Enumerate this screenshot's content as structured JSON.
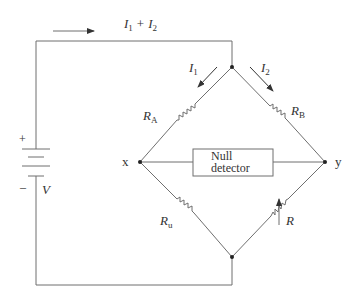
{
  "diagram": {
    "colors": {
      "wire": "#6f6f6f",
      "text": "#333333",
      "node": "#222222",
      "background": "#ffffff"
    },
    "labels": {
      "total_current_I": "I",
      "total_current_sub1": "1",
      "total_current_plus": "+",
      "total_current_I2": "I",
      "total_current_sub2": "2",
      "i1_main": "I",
      "i1_sub": "1",
      "i2_main": "I",
      "i2_sub": "2",
      "ra_main": "R",
      "ra_sub": "A",
      "rb_main": "R",
      "rb_sub": "B",
      "ru_main": "R",
      "ru_sub": "u",
      "r_var": "R",
      "node_x": "x",
      "node_y": "y",
      "battery_plus": "+",
      "battery_minus": "–",
      "battery_voltage": "V",
      "detector_line1": "Null",
      "detector_line2": "detector"
    },
    "components": [
      {
        "id": "battery",
        "type": "battery",
        "label": "V"
      },
      {
        "id": "RA",
        "type": "resistor",
        "label": "R_A",
        "branch": "top-left"
      },
      {
        "id": "RB",
        "type": "resistor",
        "label": "R_B",
        "branch": "top-right"
      },
      {
        "id": "Ru",
        "type": "resistor",
        "label": "R_u",
        "branch": "bottom-left"
      },
      {
        "id": "R",
        "type": "variable-resistor",
        "label": "R",
        "branch": "bottom-right"
      },
      {
        "id": "detector",
        "type": "null-detector",
        "label": "Null detector",
        "between": [
          "x",
          "y"
        ]
      }
    ],
    "currents": [
      {
        "label": "I1 + I2",
        "direction": "right",
        "location": "top wire"
      },
      {
        "label": "I1",
        "direction": "down-left",
        "location": "left upper branch"
      },
      {
        "label": "I2",
        "direction": "down-right",
        "location": "right upper branch"
      }
    ],
    "nodes": [
      "top",
      "x",
      "y",
      "bottom"
    ]
  }
}
